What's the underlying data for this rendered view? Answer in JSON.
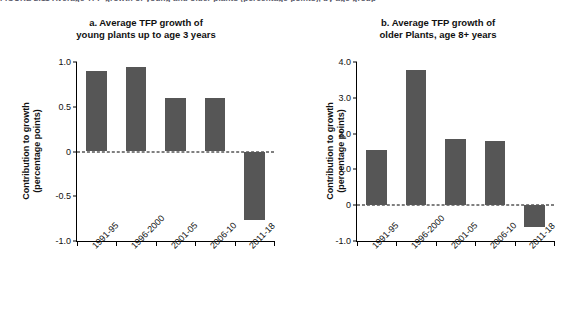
{
  "figure": {
    "clipped_caption": "FIGURE 2.11  Average TFP growth of young and older plants (percentage points), by age group",
    "bar_color": "#565656",
    "axis_color": "#000000"
  },
  "chart_data": [
    {
      "type": "bar",
      "panel": "a",
      "title_line1": "a. Average TFP growth of",
      "title_line2": "young plants up to age 3 years",
      "categories": [
        "1991-95",
        "1996-2000",
        "2001-05",
        "2006-10",
        "2011-18"
      ],
      "values": [
        0.9,
        0.94,
        0.6,
        0.6,
        -0.77
      ],
      "ylabel_line1": "Contribution to growth",
      "ylabel_line2": "(percentage points)",
      "xlabel": "",
      "ylim": [
        -1.0,
        1.0
      ],
      "yticks": [
        1.0,
        0.5,
        0,
        -0.5,
        -1.0
      ],
      "ytick_labels": [
        "1.0",
        "0.5",
        "0",
        "-0.5",
        "-1.0"
      ],
      "grid": false,
      "zero_line": true,
      "legend": "none"
    },
    {
      "type": "bar",
      "panel": "b",
      "title_line1": "b. Average TFP growth of",
      "title_line2": "older Plants, age 8+ years",
      "categories": [
        "1991-95",
        "1996-2000",
        "2001-05",
        "2006-10",
        "2011-18"
      ],
      "values": [
        1.55,
        3.78,
        1.85,
        1.78,
        -0.6
      ],
      "ylabel_line1": "Contribution to growth",
      "ylabel_line2": "(percentage points)",
      "xlabel": "",
      "ylim": [
        -1.0,
        4.0
      ],
      "yticks": [
        4.0,
        3.0,
        2.0,
        1.0,
        0,
        -1.0
      ],
      "ytick_labels": [
        "4.0",
        "3.0",
        "2.0",
        "1.0",
        "0",
        "-1.0"
      ],
      "grid": false,
      "zero_line": true,
      "legend": "none"
    }
  ]
}
